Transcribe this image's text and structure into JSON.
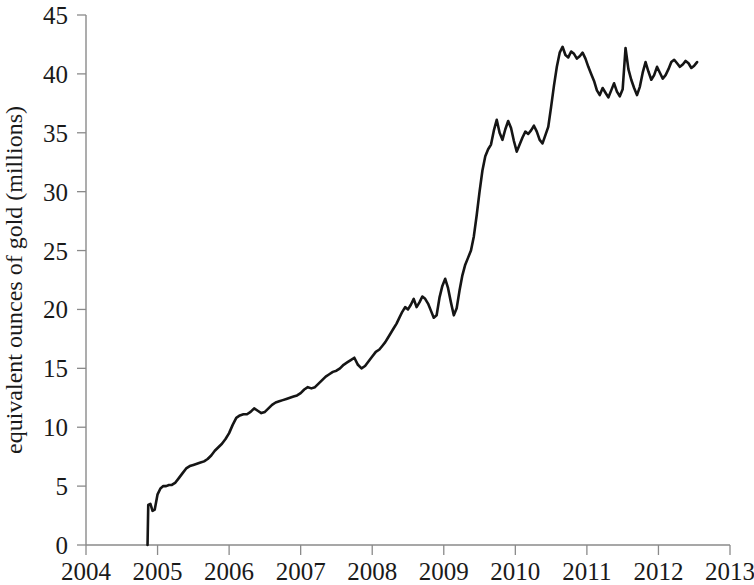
{
  "chart_data": {
    "type": "line",
    "title": "",
    "subtitle": "",
    "xlabel": "",
    "ylabel": "equivalent ounces of gold (millions)",
    "xlim": [
      2004,
      2013
    ],
    "ylim": [
      0,
      45
    ],
    "grid": false,
    "legend": null,
    "x_ticks": [
      "2004",
      "2005",
      "2006",
      "2007",
      "2008",
      "2009",
      "2010",
      "2011",
      "2012",
      "2013"
    ],
    "x_tick_values": [
      2004,
      2005,
      2006,
      2007,
      2008,
      2009,
      2010,
      2011,
      2012,
      2013
    ],
    "y_ticks": [
      "0",
      "5",
      "10",
      "15",
      "20",
      "25",
      "30",
      "35",
      "40",
      "45"
    ],
    "y_tick_values": [
      0,
      5,
      10,
      15,
      20,
      25,
      30,
      35,
      40,
      45
    ],
    "line_color": "#151515",
    "axis_color": "#8a8a8a",
    "series": [
      {
        "name": "equivalent ounces of gold",
        "x": [
          2004.86,
          2004.87,
          2004.9,
          2004.93,
          2004.96,
          2005.0,
          2005.04,
          2005.08,
          2005.12,
          2005.16,
          2005.2,
          2005.25,
          2005.3,
          2005.35,
          2005.4,
          2005.45,
          2005.5,
          2005.55,
          2005.6,
          2005.65,
          2005.7,
          2005.75,
          2005.8,
          2005.85,
          2005.9,
          2005.95,
          2006.0,
          2006.05,
          2006.1,
          2006.15,
          2006.2,
          2006.25,
          2006.3,
          2006.35,
          2006.4,
          2006.45,
          2006.5,
          2006.55,
          2006.6,
          2006.65,
          2006.7,
          2006.75,
          2006.8,
          2006.85,
          2006.9,
          2006.95,
          2007.0,
          2007.05,
          2007.1,
          2007.15,
          2007.2,
          2007.25,
          2007.3,
          2007.35,
          2007.4,
          2007.45,
          2007.5,
          2007.55,
          2007.6,
          2007.65,
          2007.7,
          2007.75,
          2007.8,
          2007.85,
          2007.9,
          2007.95,
          2008.0,
          2008.05,
          2008.1,
          2008.14,
          2008.18,
          2008.22,
          2008.26,
          2008.3,
          2008.34,
          2008.38,
          2008.42,
          2008.46,
          2008.5,
          2008.54,
          2008.58,
          2008.62,
          2008.66,
          2008.7,
          2008.74,
          2008.78,
          2008.82,
          2008.86,
          2008.9,
          2008.94,
          2008.98,
          2009.02,
          2009.06,
          2009.1,
          2009.14,
          2009.18,
          2009.22,
          2009.26,
          2009.3,
          2009.34,
          2009.38,
          2009.42,
          2009.46,
          2009.5,
          2009.54,
          2009.58,
          2009.62,
          2009.66,
          2009.7,
          2009.74,
          2009.78,
          2009.82,
          2009.86,
          2009.9,
          2009.94,
          2009.98,
          2010.02,
          2010.06,
          2010.1,
          2010.14,
          2010.18,
          2010.22,
          2010.26,
          2010.3,
          2010.34,
          2010.38,
          2010.42,
          2010.46,
          2010.5,
          2010.54,
          2010.58,
          2010.62,
          2010.66,
          2010.7,
          2010.74,
          2010.78,
          2010.82,
          2010.86,
          2010.9,
          2010.94,
          2010.98,
          2011.02,
          2011.06,
          2011.1,
          2011.14,
          2011.18,
          2011.22,
          2011.26,
          2011.3,
          2011.34,
          2011.38,
          2011.42,
          2011.46,
          2011.5,
          2011.54,
          2011.58,
          2011.62,
          2011.66,
          2011.7,
          2011.74,
          2011.78,
          2011.82,
          2011.86,
          2011.9,
          2011.94,
          2011.98,
          2012.02,
          2012.06,
          2012.1,
          2012.14,
          2012.18,
          2012.22,
          2012.26,
          2012.3,
          2012.34,
          2012.38,
          2012.42,
          2012.46,
          2012.5,
          2012.54
        ],
        "y": [
          0.0,
          3.4,
          3.5,
          2.9,
          3.0,
          4.3,
          4.8,
          5.0,
          5.0,
          5.1,
          5.1,
          5.3,
          5.7,
          6.1,
          6.5,
          6.7,
          6.8,
          6.9,
          7.0,
          7.1,
          7.3,
          7.6,
          8.0,
          8.3,
          8.6,
          9.0,
          9.5,
          10.2,
          10.8,
          11.0,
          11.1,
          11.1,
          11.3,
          11.6,
          11.4,
          11.2,
          11.3,
          11.6,
          11.9,
          12.1,
          12.2,
          12.3,
          12.4,
          12.5,
          12.6,
          12.7,
          12.9,
          13.2,
          13.4,
          13.3,
          13.4,
          13.7,
          14.0,
          14.3,
          14.5,
          14.7,
          14.8,
          15.0,
          15.3,
          15.5,
          15.7,
          15.9,
          15.3,
          15.0,
          15.2,
          15.6,
          16.0,
          16.4,
          16.6,
          16.9,
          17.2,
          17.6,
          18.0,
          18.4,
          18.8,
          19.3,
          19.8,
          20.2,
          20.0,
          20.4,
          20.9,
          20.2,
          20.6,
          21.1,
          20.9,
          20.5,
          19.9,
          19.3,
          19.5,
          21.0,
          22.0,
          22.6,
          21.8,
          20.6,
          19.5,
          20.1,
          21.6,
          22.9,
          23.8,
          24.4,
          25.0,
          26.2,
          28.0,
          30.0,
          31.8,
          33.0,
          33.6,
          34.0,
          35.2,
          36.1,
          35.0,
          34.4,
          35.3,
          36.0,
          35.4,
          34.3,
          33.4,
          34.0,
          34.6,
          35.1,
          34.9,
          35.2,
          35.6,
          35.1,
          34.4,
          34.1,
          34.8,
          35.5,
          37.2,
          39.0,
          40.6,
          41.8,
          42.3,
          41.6,
          41.4,
          41.9,
          41.7,
          41.3,
          41.5,
          41.8,
          41.3,
          40.6,
          40.0,
          39.4,
          38.6,
          38.2,
          38.8,
          38.4,
          38.0,
          38.6,
          39.2,
          38.5,
          38.1,
          38.7,
          42.2,
          40.4,
          39.5,
          38.8,
          38.2,
          38.9,
          40.1,
          41.0,
          40.2,
          39.5,
          39.9,
          40.6,
          40.1,
          39.6,
          39.9,
          40.4,
          41.0,
          41.2,
          40.9,
          40.6,
          40.8,
          41.1,
          40.9,
          40.5,
          40.7,
          41.0
        ]
      }
    ]
  }
}
